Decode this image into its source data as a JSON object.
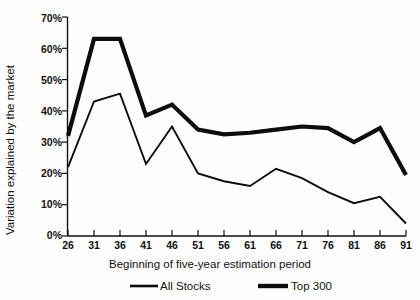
{
  "chart_data": {
    "type": "line",
    "title": "",
    "subtitle": "",
    "xlabel": "Beginning of five-year estimation period",
    "ylabel": "Variation explained by the market",
    "x": [
      26,
      31,
      36,
      41,
      46,
      51,
      56,
      61,
      66,
      71,
      76,
      81,
      86,
      91
    ],
    "xtick_labels": [
      "26",
      "31",
      "36",
      "41",
      "46",
      "51",
      "56",
      "61",
      "66",
      "71",
      "76",
      "81",
      "86",
      "91"
    ],
    "ytick_labels": [
      "0%",
      "10%",
      "20%",
      "30%",
      "40%",
      "50%",
      "60%",
      "70%"
    ],
    "ytick_values": [
      0,
      10,
      20,
      30,
      40,
      50,
      60,
      70
    ],
    "ylim": [
      0,
      70
    ],
    "xlim": [
      26,
      91
    ],
    "grid": false,
    "legend_position": "bottom",
    "series": [
      {
        "name": "All Stocks",
        "style": "thin",
        "values": [
          22,
          43,
          45.5,
          23,
          35,
          20,
          17.5,
          16,
          21.5,
          18.5,
          14,
          10.5,
          12.5,
          4
        ]
      },
      {
        "name": "Top 300",
        "style": "thick",
        "values": [
          32,
          63,
          63,
          38.5,
          42,
          34,
          32.5,
          33,
          34,
          35,
          34.5,
          30,
          34.5,
          19.5
        ]
      }
    ]
  },
  "legend": {
    "items": [
      {
        "label": "All Stocks"
      },
      {
        "label": "Top 300"
      }
    ]
  },
  "axes": {
    "y_title": "Variation explained by the market",
    "x_title": "Beginning of five-year estimation period"
  },
  "colors": {
    "ink": "#0d0d0d",
    "background": "#ffffff"
  }
}
